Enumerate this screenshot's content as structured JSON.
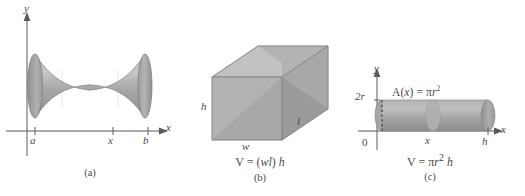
{
  "figure": {
    "background": "#ffffff",
    "ink_color": "#4a4a4a",
    "solid_fill_light": "#b9b9b9",
    "solid_fill_mid": "#a0a0a0",
    "solid_fill_dark": "#8a8a8a"
  },
  "panel_a": {
    "caption": "(a)",
    "shape_name": "solid-of-revolution-hyperboloid",
    "y_axis_label": "y",
    "x_axis_label": "x",
    "ticks": [
      {
        "label": "a"
      },
      {
        "label": "x"
      },
      {
        "label": "b"
      }
    ]
  },
  "panel_b": {
    "caption": "(b)",
    "shape_name": "rectangular-box",
    "height_label": "h",
    "width_label": "w",
    "length_label": "l",
    "formula": "V = (wl) h",
    "formula_parts": {
      "lead": "V = (",
      "w": "w",
      "l": "l",
      "close": ") ",
      "h": "h"
    }
  },
  "panel_c": {
    "caption": "(c)",
    "shape_name": "horizontal-cylinder",
    "y_axis_label": "y",
    "x_axis_label": "x",
    "origin_label": "0",
    "diameter_label": "2r",
    "cross_section_x_label": "x",
    "height_label": "h",
    "area_label_parts": {
      "lead": "A(",
      "x": "x",
      "mid": ") = π",
      "r": "r",
      "exp": "2"
    },
    "area_label": "A(x) = πr²",
    "formula": "V = πr² h",
    "formula_parts": {
      "lead": "V = π",
      "r": "r",
      "exp": "2",
      "h": "h"
    }
  }
}
